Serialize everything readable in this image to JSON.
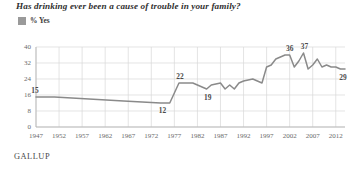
{
  "title": "Has drinking ever been a cause of trouble in your family?",
  "legend": {
    "label": "% Yes",
    "swatch_color": "#9a9a9a"
  },
  "footer": {
    "brand": "GALLUP"
  },
  "colors": {
    "line": "#8a8a8a",
    "grid": "#d8d8d8",
    "axis": "#b0b0b0",
    "text": "#6a6a6a",
    "label": "#4a4a4a"
  },
  "chart_data": {
    "type": "line",
    "title": "Has drinking ever been a cause of trouble in your family?",
    "xlabel": "",
    "ylabel": "",
    "legend_entries": [
      "% Yes"
    ],
    "legend_position": "top-left",
    "grid": true,
    "xlim": [
      1947,
      2014
    ],
    "ylim": [
      0,
      40
    ],
    "yticks": [
      0,
      8,
      16,
      24,
      32,
      40
    ],
    "xticks": [
      1947,
      1952,
      1957,
      1962,
      1967,
      1972,
      1977,
      1982,
      1987,
      1992,
      1997,
      2002,
      2007,
      2012
    ],
    "x": [
      1947,
      1951,
      1966,
      1974,
      1976,
      1978,
      1981,
      1982,
      1984,
      1985,
      1987,
      1988,
      1989,
      1990,
      1991,
      1992,
      1994,
      1995,
      1996,
      1997,
      1998,
      1999,
      2000,
      2001,
      2002,
      2003,
      2004,
      2005,
      2006,
      2007,
      2008,
      2009,
      2010,
      2011,
      2012,
      2013,
      2014
    ],
    "values": [
      15,
      15,
      13,
      12,
      12,
      22,
      22,
      21,
      19,
      21,
      22,
      19,
      21,
      19,
      22,
      23,
      24,
      23,
      22,
      30,
      31,
      34,
      35,
      36,
      36,
      30,
      33,
      37,
      29,
      31,
      34,
      30,
      31,
      30,
      30,
      29,
      29
    ],
    "point_labels": [
      {
        "year": 1947,
        "value": 15,
        "text": "15"
      },
      {
        "year": 1974,
        "value": 12,
        "text": "12"
      },
      {
        "year": 1978,
        "value": 22,
        "text": "22"
      },
      {
        "year": 1984,
        "value": 19,
        "text": "19"
      },
      {
        "year": 2002,
        "value": 36,
        "text": "36"
      },
      {
        "year": 2005,
        "value": 37,
        "text": "37"
      },
      {
        "year": 2014,
        "value": 29,
        "text": "29"
      }
    ]
  }
}
